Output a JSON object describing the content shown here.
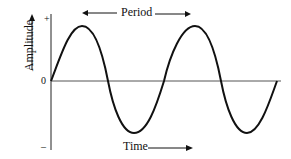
{
  "diagram": {
    "title_arrow_label": "Period",
    "x_label": "Time",
    "y_label": "Amplitude",
    "y_ticks": {
      "plus": "+",
      "zero": "0",
      "minus": "–"
    },
    "wave": {
      "type": "sine",
      "cycles": 2,
      "color": "#111111"
    }
  }
}
